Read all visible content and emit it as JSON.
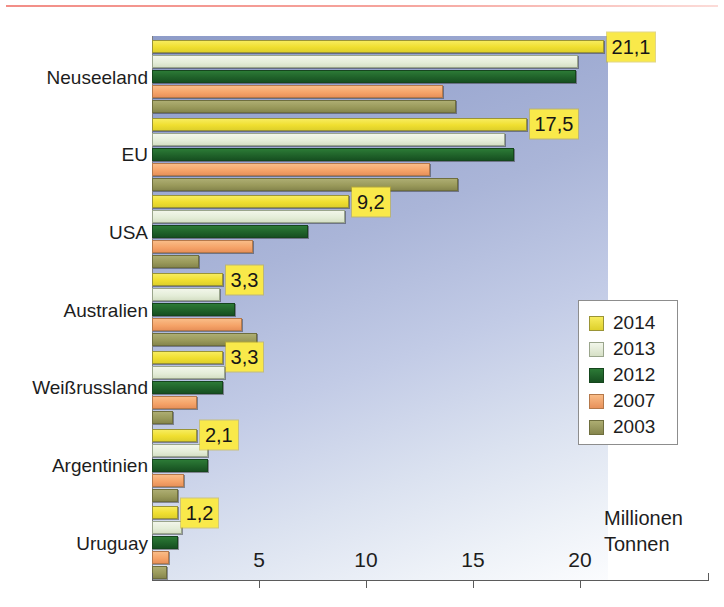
{
  "chart_data": {
    "type": "bar",
    "orientation": "horizontal",
    "title": "",
    "subtitle": "",
    "xlabel": "Millionen Tonnen",
    "ylabel": "",
    "xlim": [
      0,
      21.3
    ],
    "grid": false,
    "legend_position": "inside-right",
    "categories": [
      "Neuseeland",
      "EU",
      "USA",
      "Australien",
      "Weißrussland",
      "Argentinien",
      "Uruguay"
    ],
    "series": [
      {
        "name": "2014",
        "color": "#f0df30",
        "values": [
          21.1,
          17.5,
          9.2,
          3.3,
          3.3,
          2.1,
          1.2
        ]
      },
      {
        "name": "2013",
        "color": "#e4edd8",
        "values": [
          19.9,
          16.5,
          9.0,
          3.2,
          3.4,
          2.6,
          1.4
        ]
      },
      {
        "name": "2012",
        "color": "#1f6129",
        "values": [
          19.8,
          16.9,
          7.3,
          3.9,
          3.3,
          2.6,
          1.2
        ]
      },
      {
        "name": "2007",
        "color": "#f5a368",
        "values": [
          13.6,
          13.0,
          4.7,
          4.2,
          2.1,
          1.5,
          0.8
        ]
      },
      {
        "name": "2003",
        "color": "#99995a",
        "values": [
          14.2,
          14.3,
          2.2,
          4.9,
          1.0,
          1.2,
          0.7
        ]
      }
    ],
    "value_labels": [
      {
        "category": "Neuseeland",
        "series": "2014",
        "text": "21,1"
      },
      {
        "category": "EU",
        "series": "2014",
        "text": "17,5"
      },
      {
        "category": "USA",
        "series": "2014",
        "text": "9,2"
      },
      {
        "category": "Australien",
        "series": "2014",
        "text": "3,3"
      },
      {
        "category": "Weißrussland",
        "series": "2014",
        "text": "3,3"
      },
      {
        "category": "Argentinien",
        "series": "2014",
        "text": "2,1"
      },
      {
        "category": "Uruguay",
        "series": "2014",
        "text": "1,2"
      }
    ],
    "xticks": [
      5,
      10,
      15,
      20
    ],
    "xtick_labels": [
      "5",
      "10",
      "15",
      "20"
    ]
  },
  "axis": {
    "unit_line1": "Millionen",
    "unit_line2": "Tonnen"
  },
  "legend": {
    "items": [
      {
        "label": "2014"
      },
      {
        "label": "2013"
      },
      {
        "label": "2012"
      },
      {
        "label": "2007"
      },
      {
        "label": "2003"
      }
    ]
  }
}
